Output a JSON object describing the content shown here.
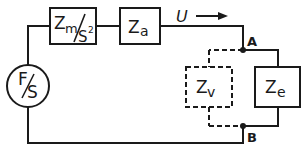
{
  "diagram": {
    "type": "circuit-block-diagram",
    "colors": {
      "line": "#1a1a1a",
      "background": "#ffffff"
    },
    "source": {
      "numerator": "F",
      "denominator": "S",
      "shape": "circle"
    },
    "blocks": {
      "zm": {
        "main": "Z",
        "sub": "m",
        "denom": "S",
        "sup": "2",
        "style": "solid"
      },
      "za": {
        "main": "Z",
        "sub": "a",
        "style": "solid"
      },
      "zv": {
        "main": "Z",
        "sub": "v",
        "style": "dashed"
      },
      "ze": {
        "main": "Z",
        "sub": "e",
        "style": "solid"
      }
    },
    "nodes": {
      "a": "A",
      "b": "B"
    },
    "signal": {
      "label": "U",
      "direction": "right"
    }
  }
}
